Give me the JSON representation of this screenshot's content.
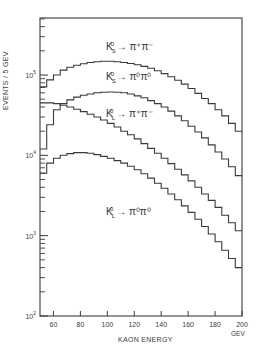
{
  "chart_data": {
    "type": "line",
    "style": "step-histogram",
    "title": "",
    "xlabel": "KAON ENERGY",
    "xunit": "GEV",
    "ylabel": "EVENTS / 5 GEV",
    "yscale": "log",
    "xlim": [
      50,
      200
    ],
    "ylim": [
      100,
      500000
    ],
    "bin_width": 5,
    "grid": false,
    "legend": "inline labels",
    "xticks": [
      60,
      80,
      100,
      120,
      140,
      160,
      180,
      200
    ],
    "yticks": [
      "10^2",
      "10^3",
      "10^4",
      "10^5"
    ],
    "x": [
      52.5,
      57.5,
      62.5,
      67.5,
      72.5,
      77.5,
      82.5,
      87.5,
      92.5,
      97.5,
      102.5,
      107.5,
      112.5,
      117.5,
      122.5,
      127.5,
      132.5,
      137.5,
      142.5,
      147.5,
      152.5,
      157.5,
      162.5,
      167.5,
      172.5,
      177.5,
      182.5,
      187.5,
      192.5,
      197.5
    ],
    "series": [
      {
        "name": "K_S^0 → π+π−",
        "label_html": "K<sup>0</sup><sub>S</sub> → π<sup>+</sup>π<sup>−</sup>",
        "values": [
          71000,
          87000,
          100000,
          115000,
          125000,
          132000,
          138000,
          143000,
          146000,
          148000,
          148000,
          146000,
          143000,
          139000,
          134000,
          128000,
          121000,
          113000,
          104000,
          95000,
          86000,
          77000,
          68000,
          59000,
          51000,
          44000,
          37000,
          31000,
          25000,
          20000
        ]
      },
      {
        "name": "K_S^0 → π0π0",
        "label_html": "K<sup>0</sup><sub>S</sub> → π<sup>0</sup>π<sup>0</sup>",
        "values": [
          12000,
          24000,
          37000,
          44000,
          49000,
          53000,
          56000,
          58000,
          60000,
          61000,
          61500,
          61000,
          60000,
          58000,
          55000,
          52000,
          48000,
          44000,
          40000,
          35500,
          31000,
          27000,
          23000,
          19500,
          16500,
          13500,
          11000,
          9000,
          7200,
          5600
        ]
      },
      {
        "name": "K_L^0 → π+π−",
        "label_html": "K<sup>0</sup><sub>L</sub> → π<sup>+</sup>π<sup>−</sup>",
        "values": [
          45000,
          45000,
          44000,
          42000,
          40000,
          37500,
          35000,
          32500,
          30000,
          27500,
          25000,
          22500,
          20000,
          18000,
          16000,
          14000,
          12200,
          10600,
          9200,
          7900,
          6700,
          5700,
          4800,
          4000,
          3300,
          2750,
          2250,
          1800,
          1450,
          1150
        ]
      },
      {
        "name": "K_L^0 → π0π0",
        "label_html": "K<sup>0</sup><sub>L</sub> → π<sup>0</sup>π<sup>0</sup>",
        "values": [
          6000,
          8000,
          9200,
          10000,
          10500,
          10800,
          10800,
          10600,
          10200,
          9700,
          9200,
          8600,
          8000,
          7300,
          6600,
          5900,
          5200,
          4500,
          3900,
          3300,
          2800,
          2350,
          1950,
          1600,
          1300,
          1050,
          840,
          660,
          520,
          400
        ]
      }
    ]
  },
  "axes": {
    "ylabel": "EVENTS / 5 GEV",
    "xlabel": "KAON ENERGY",
    "xunit": "GEV"
  },
  "labels": [
    {
      "base": "K",
      "sup": "0",
      "sub": "S",
      "arrow": "→",
      "products": "π⁺π⁻"
    },
    {
      "base": "K",
      "sup": "0",
      "sub": "S",
      "arrow": "→",
      "products": "π⁰π⁰"
    },
    {
      "base": "K",
      "sup": "0",
      "sub": "L",
      "arrow": "→",
      "products": "π⁺π⁻"
    },
    {
      "base": "K",
      "sup": "0",
      "sub": "L",
      "arrow": "→",
      "products": "π⁰π⁰"
    }
  ],
  "colors": {
    "ink": "#3a3a3a",
    "background": "#ffffff"
  }
}
